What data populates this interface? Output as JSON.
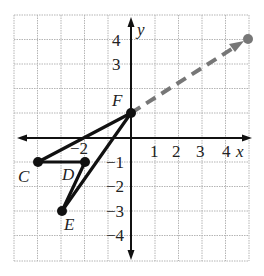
{
  "diagram": {
    "grid": {
      "x_min": -5,
      "x_max": 5,
      "y_min": -5,
      "y_max": 5,
      "color": "#b0b0b0"
    },
    "axes": {
      "x_label": "x",
      "y_label": "y"
    },
    "x_ticks": [
      "−2",
      "1",
      "2",
      "3",
      "4"
    ],
    "y_ticks": [
      "4",
      "3",
      "−1",
      "−2",
      "−3",
      "−4"
    ],
    "points": [
      {
        "name": "C",
        "coords": "(-4, -1)"
      },
      {
        "name": "D",
        "coords": "(-2, -1)"
      },
      {
        "name": "E",
        "coords": "(-3, -3)"
      },
      {
        "name": "F",
        "coords": "(0, 1)"
      }
    ],
    "arrow": {
      "from": "F",
      "to": "(5, 4)",
      "style": "dashed",
      "color": "#777777"
    },
    "segments": [
      "C-D",
      "C-F",
      "D-E",
      "E-F"
    ]
  }
}
